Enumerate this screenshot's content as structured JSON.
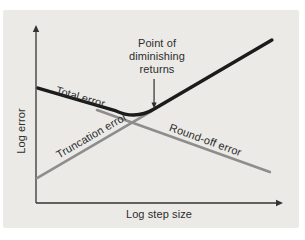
{
  "chart_data": {
    "type": "line",
    "title": "",
    "xlabel": "Log step size",
    "ylabel": "Log error",
    "grid": false,
    "axis_ticks": "none",
    "qualitative": true,
    "legend_position": "inline-labels",
    "series": [
      {
        "name": "Truncation error",
        "color": "#8d8d8d",
        "width": 2.6,
        "points": [
          [
            0.004,
            0.142
          ],
          [
            0.47,
            0.523
          ]
        ]
      },
      {
        "name": "Round-off error",
        "color": "#8d8d8d",
        "width": 2.6,
        "points": [
          [
            0.247,
            0.528
          ],
          [
            0.947,
            0.176
          ]
        ]
      },
      {
        "name": "Total error",
        "color": "#1b1b1b",
        "width": 3.4,
        "curve": "smooth-mid",
        "points": [
          [
            0.008,
            0.653
          ],
          [
            0.324,
            0.523
          ],
          [
            0.405,
            0.472
          ],
          [
            0.478,
            0.534
          ],
          [
            0.955,
            0.926
          ]
        ]
      }
    ],
    "annotation": {
      "text": "Point of\ndiminishing\nreturns",
      "arrow": {
        "x": 0.478,
        "y_from": 0.705,
        "y_to": 0.562
      }
    }
  },
  "colors": {
    "panel": "#ebeae7",
    "axis": "#333333",
    "text": "#2d2d2d",
    "background": "#ffffff"
  }
}
